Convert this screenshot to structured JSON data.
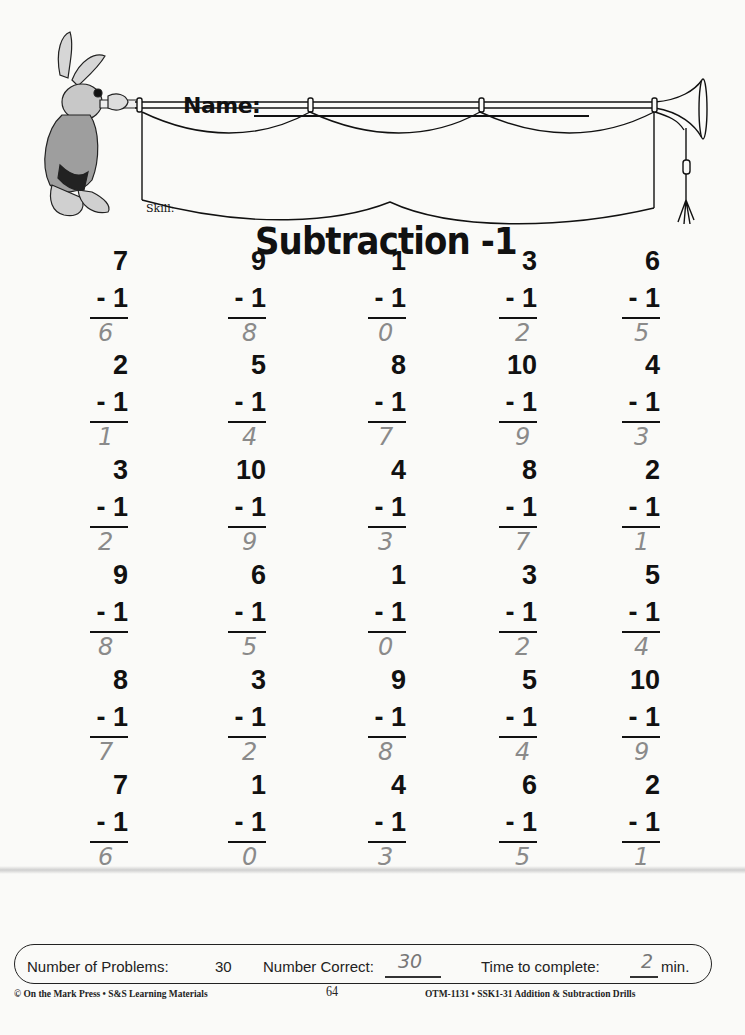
{
  "header": {
    "name_label": "Name:",
    "skill_label": "Skill:",
    "title": "Subtraction -1"
  },
  "icons": {
    "mascot": "rabbit-herald-trumpet-illustration",
    "banner": "trumpet-banner-illustration"
  },
  "problems": [
    {
      "top": "7",
      "sub": "- 1",
      "answer": "6"
    },
    {
      "top": "9",
      "sub": "- 1",
      "answer": "8"
    },
    {
      "top": "1",
      "sub": "- 1",
      "answer": "0"
    },
    {
      "top": "3",
      "sub": "- 1",
      "answer": "2"
    },
    {
      "top": "6",
      "sub": "- 1",
      "answer": "5"
    },
    {
      "top": "2",
      "sub": "- 1",
      "answer": "1"
    },
    {
      "top": "5",
      "sub": "- 1",
      "answer": "4"
    },
    {
      "top": "8",
      "sub": "- 1",
      "answer": "7"
    },
    {
      "top": "10",
      "sub": "- 1",
      "answer": "9"
    },
    {
      "top": "4",
      "sub": "- 1",
      "answer": "3"
    },
    {
      "top": "3",
      "sub": "- 1",
      "answer": "2"
    },
    {
      "top": "10",
      "sub": "- 1",
      "answer": "9"
    },
    {
      "top": "4",
      "sub": "- 1",
      "answer": "3"
    },
    {
      "top": "8",
      "sub": "- 1",
      "answer": "7"
    },
    {
      "top": "2",
      "sub": "- 1",
      "answer": "1"
    },
    {
      "top": "9",
      "sub": "- 1",
      "answer": "8"
    },
    {
      "top": "6",
      "sub": "- 1",
      "answer": "5"
    },
    {
      "top": "1",
      "sub": "- 1",
      "answer": "0"
    },
    {
      "top": "3",
      "sub": "- 1",
      "answer": "2"
    },
    {
      "top": "5",
      "sub": "- 1",
      "answer": "4"
    },
    {
      "top": "8",
      "sub": "- 1",
      "answer": "7"
    },
    {
      "top": "3",
      "sub": "- 1",
      "answer": "2"
    },
    {
      "top": "9",
      "sub": "- 1",
      "answer": "8"
    },
    {
      "top": "5",
      "sub": "- 1",
      "answer": "4"
    },
    {
      "top": "10",
      "sub": "- 1",
      "answer": "9"
    },
    {
      "top": "7",
      "sub": "- 1",
      "answer": "6"
    },
    {
      "top": "1",
      "sub": "- 1",
      "answer": "0"
    },
    {
      "top": "4",
      "sub": "- 1",
      "answer": "3"
    },
    {
      "top": "6",
      "sub": "- 1",
      "answer": "5"
    },
    {
      "top": "2",
      "sub": "- 1",
      "answer": "1"
    }
  ],
  "summary": {
    "problems_label": "Number of Problems:",
    "problems_value": "30",
    "correct_label": "Number Correct:",
    "correct_value": "30",
    "time_label": "Time to complete:",
    "time_value": "2",
    "time_unit": "min."
  },
  "footer": {
    "publisher": "© On the Mark Press • S&S Learning Materials",
    "page_number": "64",
    "product": "OTM-1131 • SSK1-31 Addition & Subtraction Drills"
  },
  "colors": {
    "ink": "#111111",
    "pencil": "#8a8a8a",
    "paper": "#fafaf8"
  }
}
